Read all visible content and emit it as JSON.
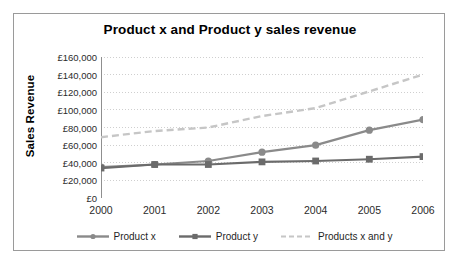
{
  "chart_data": {
    "type": "line",
    "title": "Product x and Product y sales revenue",
    "xlabel": "",
    "ylabel": "Sales Revenue",
    "categories": [
      "2000",
      "2001",
      "2002",
      "2003",
      "2004",
      "2005",
      "2006"
    ],
    "ylim": [
      0,
      160000
    ],
    "ytick_values": [
      0,
      20000,
      40000,
      60000,
      80000,
      100000,
      120000,
      140000,
      160000
    ],
    "ytick_labels": [
      "£0",
      "£20,000",
      "£40,000",
      "£60,000",
      "£80,000",
      "£100,000",
      "£120,000",
      "£140,000",
      "£160,000"
    ],
    "grid": true,
    "grid_style": "dotted-horizontal",
    "legend_position": "bottom",
    "series": [
      {
        "name": "Product x",
        "values": [
          35000,
          38000,
          42000,
          52000,
          60000,
          77000,
          89000
        ],
        "color": "#8a8a8a",
        "marker": "circle",
        "line_style": "solid"
      },
      {
        "name": "Product y",
        "values": [
          34000,
          38000,
          38000,
          41000,
          42000,
          44000,
          47000
        ],
        "color": "#6b6b6b",
        "marker": "square",
        "line_style": "solid"
      },
      {
        "name": "Products x and y",
        "values": [
          69000,
          76000,
          80000,
          93000,
          102000,
          121000,
          140000
        ],
        "color": "#c6c6c6",
        "marker": "none",
        "line_style": "dashed"
      }
    ]
  },
  "frame": {
    "border_color": "#9a9a9a",
    "background": "#ffffff"
  }
}
